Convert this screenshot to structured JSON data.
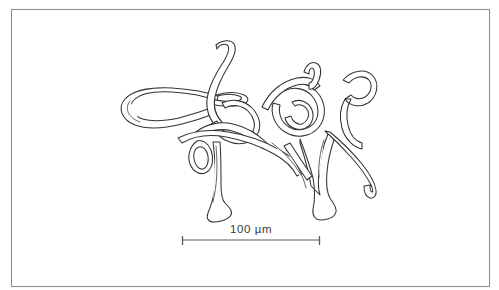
{
  "figure": {
    "kind": "scientific-line-drawing",
    "subject_description": "Tangled filamentous organism rendered as outline contour drawing",
    "background_color": "#ffffff",
    "ink_color": "#333333",
    "frame": {
      "present": true,
      "stroke_color": "#8d8d8d",
      "x": 11,
      "y": 9,
      "width": 479,
      "height": 278
    }
  },
  "scale_bar": {
    "label": "100 µm",
    "value": 100,
    "unit": "µm",
    "line_color": "#5a5a5a",
    "x_start": 182,
    "x_end": 320,
    "y": 240,
    "tick_height": 9,
    "label_x": 251,
    "label_y": 233
  },
  "drawing": {
    "bounds": {
      "x": 118,
      "y": 38,
      "width": 262,
      "height": 185
    },
    "element_count": 14,
    "elements": [
      {
        "name": "large-left-loop",
        "note": "broad elongated hairpin loop on the left"
      },
      {
        "name": "upper-tendril",
        "note": "long filament rising to upper centre"
      },
      {
        "name": "central-tangle",
        "note": "dense interwoven coils in the middle"
      },
      {
        "name": "right-coil-cluster",
        "note": "overlapping rings on the right"
      },
      {
        "name": "right-hook",
        "note": "crook / question-mark shaped terminus far right"
      },
      {
        "name": "lower-left-branch",
        "note": "tapering leg descending at lower left"
      },
      {
        "name": "lower-right-branch",
        "note": "forked stalk descending at lower right"
      },
      {
        "name": "lower-right-tail",
        "note": "curved tail sweeping right and down"
      },
      {
        "name": "small-lower-loop",
        "note": "small closed loop below centre-left"
      }
    ]
  }
}
